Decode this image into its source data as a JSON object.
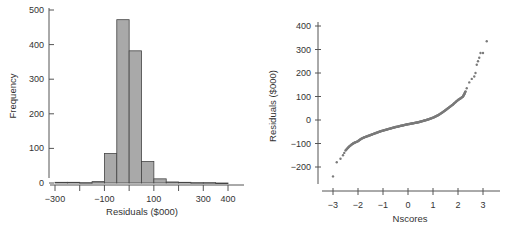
{
  "chart_data": [
    {
      "type": "bar",
      "subtype": "histogram",
      "title": "",
      "xlabel": "Residuals ($000)",
      "ylabel": "Frequency",
      "xlim": [
        -300,
        400
      ],
      "ylim": [
        0,
        500
      ],
      "bin_width": 50,
      "bin_edges": [
        -300,
        -250,
        -200,
        -150,
        -100,
        -50,
        0,
        50,
        100,
        150,
        200,
        250,
        300,
        350,
        400
      ],
      "values": [
        2,
        2,
        1,
        4,
        85,
        472,
        382,
        62,
        12,
        3,
        2,
        1,
        1,
        0
      ],
      "x_ticks": [
        -300,
        -200,
        -100,
        0,
        100,
        200,
        300,
        400
      ],
      "x_tick_labels": [
        "-300",
        "",
        "-100",
        "",
        "100",
        "",
        "300",
        "400"
      ],
      "y_ticks": [
        0,
        100,
        200,
        300,
        400,
        500
      ],
      "y_tick_labels": [
        "0",
        "100",
        "200",
        "300",
        "400",
        "500"
      ],
      "grid": false,
      "bar_color": "#a9a9a9"
    },
    {
      "type": "scatter",
      "subtype": "normal-probability-plot",
      "title": "",
      "xlabel": "Nscores",
      "ylabel": "Residuals ($000)",
      "xlim": [
        -3.2,
        3.4
      ],
      "ylim": [
        -250,
        420
      ],
      "x_ticks": [
        -3,
        -2,
        -1,
        0,
        1,
        2,
        3
      ],
      "x_tick_labels": [
        "-3",
        "-2",
        "-1",
        "0",
        "1",
        "2",
        "3"
      ],
      "y_ticks": [
        -200,
        -100,
        0,
        100,
        200,
        300,
        400
      ],
      "y_tick_labels": [
        "-200",
        "-100",
        "0",
        "100",
        "200",
        "300",
        "400"
      ],
      "grid": false,
      "point_color": "#7a7a7a",
      "points": [
        [
          -3.0,
          -240
        ],
        [
          -2.85,
          -180
        ],
        [
          -2.7,
          -165
        ],
        [
          -2.6,
          -150
        ],
        [
          -2.55,
          -140
        ],
        [
          -2.5,
          -130
        ],
        [
          -2.4,
          -118
        ],
        [
          -2.3,
          -108
        ],
        [
          -2.2,
          -100
        ],
        [
          -2.1,
          -95
        ],
        [
          -2.0,
          -90
        ],
        [
          -1.9,
          -82
        ],
        [
          -1.8,
          -76
        ],
        [
          -1.7,
          -72
        ],
        [
          -1.6,
          -68
        ],
        [
          -1.5,
          -64
        ],
        [
          -1.4,
          -60
        ],
        [
          -1.3,
          -56
        ],
        [
          -1.2,
          -52
        ],
        [
          -1.1,
          -48
        ],
        [
          -1.0,
          -45
        ],
        [
          -0.9,
          -42
        ],
        [
          -0.8,
          -39
        ],
        [
          -0.7,
          -36
        ],
        [
          -0.6,
          -33
        ],
        [
          -0.5,
          -30
        ],
        [
          -0.4,
          -28
        ],
        [
          -0.3,
          -25
        ],
        [
          -0.2,
          -23
        ],
        [
          -0.1,
          -20
        ],
        [
          0.0,
          -18
        ],
        [
          0.1,
          -16
        ],
        [
          0.2,
          -14
        ],
        [
          0.3,
          -12
        ],
        [
          0.4,
          -10
        ],
        [
          0.5,
          -7
        ],
        [
          0.6,
          -4
        ],
        [
          0.7,
          -1
        ],
        [
          0.8,
          2
        ],
        [
          0.9,
          6
        ],
        [
          1.0,
          10
        ],
        [
          1.1,
          15
        ],
        [
          1.2,
          20
        ],
        [
          1.3,
          27
        ],
        [
          1.4,
          34
        ],
        [
          1.5,
          42
        ],
        [
          1.6,
          50
        ],
        [
          1.7,
          58
        ],
        [
          1.8,
          66
        ],
        [
          1.9,
          76
        ],
        [
          2.0,
          85
        ],
        [
          2.1,
          92
        ],
        [
          2.2,
          100
        ],
        [
          2.25,
          110
        ],
        [
          2.3,
          122
        ],
        [
          2.35,
          135
        ],
        [
          2.45,
          160
        ],
        [
          2.55,
          175
        ],
        [
          2.65,
          185
        ],
        [
          2.7,
          200
        ],
        [
          2.75,
          235
        ],
        [
          2.8,
          250
        ],
        [
          2.85,
          265
        ],
        [
          2.9,
          285
        ],
        [
          3.0,
          285
        ],
        [
          3.15,
          335
        ]
      ]
    }
  ],
  "caption_fragment": ""
}
